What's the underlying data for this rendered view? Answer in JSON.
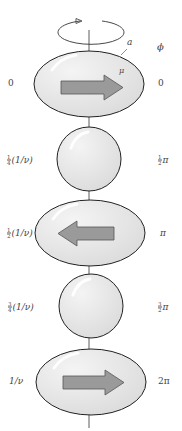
{
  "diagram": {
    "header": {
      "phase_symbol": "ϕ",
      "axis_label_a": "a",
      "moment_label_mu": "μ"
    },
    "colors": {
      "body_fill": "#e2e2e2",
      "highlight": "#ffffff",
      "outline": "#222222",
      "arrow_fill": "#9a9a9a",
      "arrow_stroke": "#555555"
    },
    "stages": [
      {
        "shape": "oblate",
        "arrow": "right",
        "time_label": {
          "whole": "0"
        },
        "phase_label": {
          "whole": "0"
        }
      },
      {
        "shape": "sphere",
        "arrow": "none",
        "time_label": {
          "num": "1",
          "den": "4",
          "rest": "(1/ν)"
        },
        "phase_label": {
          "num": "1",
          "den": "2",
          "rest": "π"
        }
      },
      {
        "shape": "oblate",
        "arrow": "left",
        "time_label": {
          "num": "1",
          "den": "2",
          "rest": "(1/ν)"
        },
        "phase_label": {
          "whole": "π"
        }
      },
      {
        "shape": "sphere",
        "arrow": "none",
        "time_label": {
          "num": "3",
          "den": "4",
          "rest": "(1/ν)"
        },
        "phase_label": {
          "num": "3",
          "den": "2",
          "rest": "π"
        }
      },
      {
        "shape": "oblate",
        "arrow": "right",
        "time_label": {
          "whole": "1/ν"
        },
        "phase_label": {
          "whole": "2π"
        }
      }
    ]
  }
}
